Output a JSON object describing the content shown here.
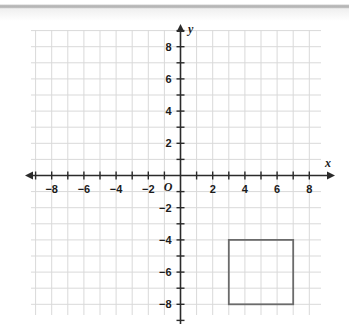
{
  "chart_data": {
    "type": "scatter",
    "title": "",
    "xlabel": "x",
    "ylabel": "y",
    "grid": true,
    "legend": false,
    "xlim": [
      -9,
      9
    ],
    "ylim": [
      -9,
      9
    ],
    "x_tick_labels": [
      "-8",
      "-6",
      "-4",
      "-2",
      "2",
      "4",
      "6",
      "8"
    ],
    "x_tick_values": [
      -8,
      -6,
      -4,
      -2,
      2,
      4,
      6,
      8
    ],
    "y_tick_labels": [
      "8",
      "6",
      "4",
      "2",
      "-2",
      "-4",
      "-6",
      "-8"
    ],
    "y_tick_values": [
      8,
      6,
      4,
      2,
      -2,
      -4,
      -6,
      -8
    ],
    "minor_tick_step": 1,
    "origin_label": "O",
    "shapes": [
      {
        "name": "square",
        "type": "rectangle",
        "vertices": [
          [
            3,
            -4
          ],
          [
            7,
            -4
          ],
          [
            7,
            -8
          ],
          [
            3,
            -8
          ]
        ],
        "x_min": 3,
        "x_max": 7,
        "y_min": -8,
        "y_max": -4,
        "width": 4,
        "height": 4,
        "fill": "none",
        "stroke": "#6b6b6b"
      }
    ]
  },
  "axes": {
    "x_label": "x",
    "y_label": "y",
    "origin_label": "O"
  },
  "ticks": {
    "x": [
      {
        "label": "-8",
        "value": -8
      },
      {
        "label": "-6",
        "value": -6
      },
      {
        "label": "-4",
        "value": -4
      },
      {
        "label": "-2",
        "value": -2
      },
      {
        "label": "2",
        "value": 2
      },
      {
        "label": "4",
        "value": 4
      },
      {
        "label": "6",
        "value": 6
      },
      {
        "label": "8",
        "value": 8
      }
    ],
    "y": [
      {
        "label": "8",
        "value": 8
      },
      {
        "label": "6",
        "value": 6
      },
      {
        "label": "4",
        "value": 4
      },
      {
        "label": "2",
        "value": 2
      },
      {
        "label": "-2",
        "value": -2
      },
      {
        "label": "-4",
        "value": -4
      },
      {
        "label": "-6",
        "value": -6
      },
      {
        "label": "-8",
        "value": -8
      }
    ]
  },
  "colors": {
    "grid_line": "#d9d9d9",
    "grid_major": "#cfcfcf",
    "axis": "#2b2b2b",
    "shape_stroke": "#6b6b6b",
    "text": "#1b1b1b",
    "background": "#ffffff"
  }
}
